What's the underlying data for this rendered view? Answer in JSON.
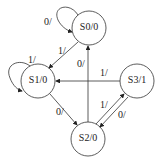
{
  "diagram": {
    "type": "state-diagram",
    "states": [
      {
        "id": "S0",
        "label": "S0/0",
        "cx": 89,
        "cy": 28
      },
      {
        "id": "S1",
        "label": "S1/0",
        "cx": 38,
        "cy": 81
      },
      {
        "id": "S3",
        "label": "S3/1",
        "cx": 137,
        "cy": 81
      },
      {
        "id": "S2",
        "label": "S2/0",
        "cx": 88,
        "cy": 139
      }
    ],
    "transitions": [
      {
        "from": "S0",
        "to": "S0",
        "label": "0/"
      },
      {
        "from": "S0",
        "to": "S1",
        "label": "1/"
      },
      {
        "from": "S1",
        "to": "S1",
        "label": "1/"
      },
      {
        "from": "S1",
        "to": "S2",
        "label": "0/"
      },
      {
        "from": "S2",
        "to": "S0",
        "label": "0/"
      },
      {
        "from": "S3",
        "to": "S1",
        "label": "1/"
      },
      {
        "from": "S2",
        "to": "S3",
        "label": "1/"
      },
      {
        "from": "S3",
        "to": "S2",
        "label": "0/"
      }
    ]
  }
}
